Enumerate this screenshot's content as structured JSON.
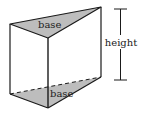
{
  "diagram": {
    "type": "triangular-prism",
    "labels": {
      "top_base": "base",
      "bottom_base": "base",
      "height": "height"
    },
    "colors": {
      "stroke": "#1a1a1a",
      "base_fill": "#bdbdbd",
      "background": "#ffffff"
    }
  }
}
